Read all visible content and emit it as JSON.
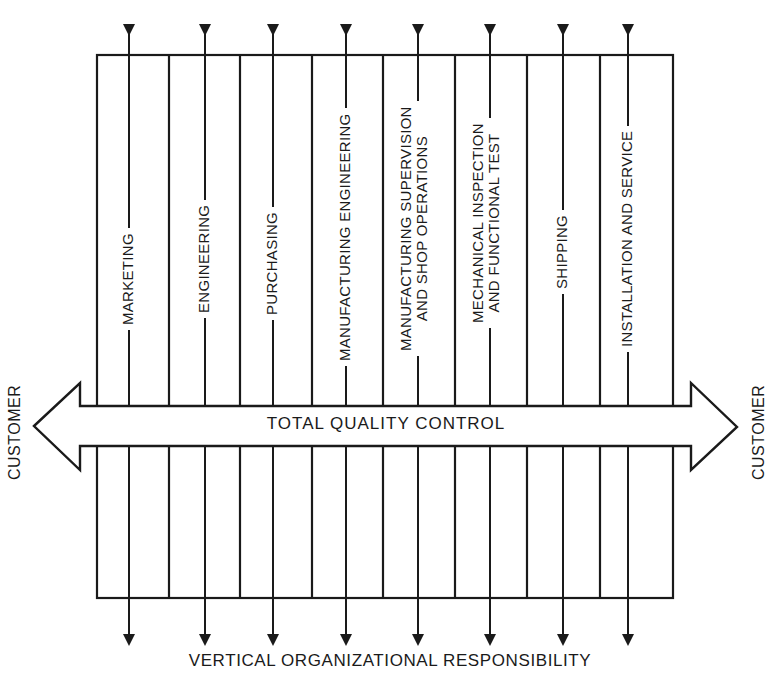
{
  "diagram": {
    "type": "total-quality-control-organization",
    "center_band_label": "TOTAL QUALITY CONTROL",
    "left_endpoint_label": "CUSTOMER",
    "right_endpoint_label": "CUSTOMER",
    "bottom_caption": "VERTICAL ORGANIZATIONAL RESPONSIBILITY",
    "columns": [
      {
        "label_line1": "MARKETING",
        "label_line2": ""
      },
      {
        "label_line1": "ENGINEERING",
        "label_line2": ""
      },
      {
        "label_line1": "PURCHASING",
        "label_line2": ""
      },
      {
        "label_line1": "MANUFACTURING ENGINEERING",
        "label_line2": ""
      },
      {
        "label_line1": "MANUFACTURING SUPERVISION",
        "label_line2": "AND SHOP OPERATIONS"
      },
      {
        "label_line1": "MECHANICAL INSPECTION",
        "label_line2": "AND FUNCTIONAL TEST"
      },
      {
        "label_line1": "SHIPPING",
        "label_line2": ""
      },
      {
        "label_line1": "INSTALLATION AND SERVICE",
        "label_line2": ""
      }
    ],
    "colors": {
      "line": "#1a1a1a",
      "background": "#ffffff"
    }
  }
}
